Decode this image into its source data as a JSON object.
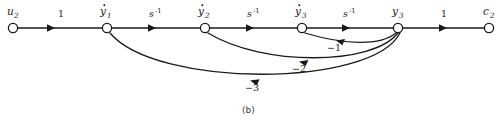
{
  "figure": {
    "caption": "(b)",
    "type": "signal-flow-graph",
    "width": 501,
    "height": 122,
    "stroke_color": "#1a1a1a",
    "background_color": "#ffffff"
  },
  "nodes": [
    {
      "id": "u2",
      "base": "u",
      "sub": "2",
      "dot": false,
      "x": 13,
      "y": 28
    },
    {
      "id": "ydot1",
      "base": "y",
      "sub": "1",
      "dot": true,
      "x": 107,
      "y": 28
    },
    {
      "id": "ydot2",
      "base": "y",
      "sub": "2",
      "dot": true,
      "x": 205,
      "y": 28
    },
    {
      "id": "ydot3",
      "base": "y",
      "sub": "3",
      "dot": true,
      "x": 302,
      "y": 28
    },
    {
      "id": "y3",
      "base": "y",
      "sub": "3",
      "dot": false,
      "x": 398,
      "y": 28
    },
    {
      "id": "c2",
      "base": "c",
      "sub": "2",
      "dot": false,
      "x": 489,
      "y": 28
    }
  ],
  "forward_edges": [
    {
      "from": "u2",
      "to": "ydot1",
      "gain": "1",
      "gain_sup": "",
      "label_x": 60,
      "label_y": 17
    },
    {
      "from": "ydot1",
      "to": "ydot2",
      "gain": "s",
      "gain_sup": "-1",
      "label_x": 152,
      "label_y": 17
    },
    {
      "from": "ydot2",
      "to": "ydot3",
      "gain": "s",
      "gain_sup": "-1",
      "label_x": 250,
      "label_y": 17
    },
    {
      "from": "ydot3",
      "to": "y3",
      "gain": "s",
      "gain_sup": "-1",
      "label_x": 346,
      "label_y": 17
    },
    {
      "from": "y3",
      "to": "c2",
      "gain": "1",
      "gain_sup": "",
      "label_x": 443,
      "label_y": 17
    }
  ],
  "feedback_edges": [
    {
      "from": "y3",
      "to": "ydot3",
      "gain": "−1",
      "label_x": 334,
      "label_y": 48
    },
    {
      "from": "y3",
      "to": "ydot2",
      "gain": "−2",
      "label_x": 299,
      "label_y": 69
    },
    {
      "from": "y3",
      "to": "ydot1",
      "gain": "−3",
      "label_x": 253,
      "label_y": 92
    }
  ]
}
